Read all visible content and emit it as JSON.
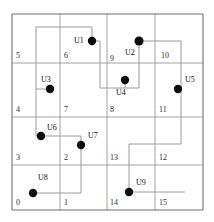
{
  "diagram": {
    "type": "grid-with-nodes-and-paths",
    "grid": {
      "columns": 4,
      "rows": 4,
      "outer_border": {
        "x": 12,
        "y": 14,
        "width": 191,
        "height": 196
      },
      "column_x": [
        12,
        60,
        107,
        155,
        203
      ],
      "row_y": [
        14,
        63,
        117,
        165,
        210
      ],
      "line_color": "#8a8a8a",
      "border_color": "#6f6f6f"
    },
    "cells": [
      {
        "id": "cell-5",
        "label": "5",
        "x": 16,
        "y": 52
      },
      {
        "id": "cell-6",
        "label": "6",
        "x": 64,
        "y": 52
      },
      {
        "id": "cell-9",
        "label": "9",
        "x": 110,
        "y": 55
      },
      {
        "id": "cell-10",
        "label": "10",
        "x": 161,
        "y": 52
      },
      {
        "id": "cell-4",
        "label": "4",
        "x": 16,
        "y": 106
      },
      {
        "id": "cell-7",
        "label": "7",
        "x": 64,
        "y": 106
      },
      {
        "id": "cell-8",
        "label": "8",
        "x": 110,
        "y": 106
      },
      {
        "id": "cell-11",
        "label": "11",
        "x": 159,
        "y": 106
      },
      {
        "id": "cell-3",
        "label": "3",
        "x": 16,
        "y": 154
      },
      {
        "id": "cell-2",
        "label": "2",
        "x": 64,
        "y": 154
      },
      {
        "id": "cell-13",
        "label": "13",
        "x": 110,
        "y": 154
      },
      {
        "id": "cell-12",
        "label": "12",
        "x": 159,
        "y": 154
      },
      {
        "id": "cell-0",
        "label": "0",
        "x": 16,
        "y": 199
      },
      {
        "id": "cell-1",
        "label": "1",
        "x": 64,
        "y": 199
      },
      {
        "id": "cell-14",
        "label": "14",
        "x": 110,
        "y": 199
      },
      {
        "id": "cell-15",
        "label": "15",
        "x": 159,
        "y": 199
      }
    ],
    "nodes": [
      {
        "id": "U1",
        "label": "U1",
        "cx": 92,
        "cy": 41,
        "r": 4.2,
        "label_x": 74,
        "label_y": 37
      },
      {
        "id": "U2",
        "label": "U2",
        "cx": 139,
        "cy": 41,
        "r": 4.5,
        "label_x": 125,
        "label_y": 49
      },
      {
        "id": "U3",
        "label": "U3",
        "cx": 50,
        "cy": 89,
        "r": 4.2,
        "label_x": 41,
        "label_y": 76
      },
      {
        "id": "U4",
        "label": "U4",
        "cx": 125,
        "cy": 80,
        "r": 4.2,
        "label_x": 116,
        "label_y": 89
      },
      {
        "id": "U5",
        "label": "U5",
        "cx": 178,
        "cy": 89,
        "r": 4.2,
        "label_x": 185,
        "label_y": 76
      },
      {
        "id": "U6",
        "label": "U6",
        "cx": 41,
        "cy": 136,
        "r": 4.2,
        "label_x": 47,
        "label_y": 124
      },
      {
        "id": "U7",
        "label": "U7",
        "cx": 81,
        "cy": 145,
        "r": 4.2,
        "label_x": 88,
        "label_y": 132
      },
      {
        "id": "U8",
        "label": "U8",
        "cx": 33,
        "cy": 193,
        "r": 4.2,
        "label_x": 38,
        "label_y": 174
      },
      {
        "id": "U9",
        "label": "U9",
        "cx": 129,
        "cy": 192,
        "r": 4.2,
        "label_x": 136,
        "label_y": 179
      }
    ],
    "paths": [
      {
        "id": "path-u1-u3",
        "points": "92,41 92,27 36,27 36,89 50,89",
        "color": "#9a9a9a"
      },
      {
        "id": "path-u1-u4",
        "points": "92,41 100,41 100,88 125,88 125,80",
        "color": "#9a9a9a"
      },
      {
        "id": "path-u3-u6",
        "points": "36,89 36,136 41,136",
        "color": "#9a9a9a"
      },
      {
        "id": "path-u6-u7",
        "points": "41,136 81,136 81,145",
        "color": "#9a9a9a"
      },
      {
        "id": "path-u7-u8",
        "points": "81,145 81,193 33,193",
        "color": "#9a9a9a"
      },
      {
        "id": "path-u2-u5",
        "points": "139,41 181,41 181,89 178,89",
        "color": "#9a9a9a"
      },
      {
        "id": "path-u2-u4",
        "points": "139,41 139,88 125,88",
        "color": "#9a9a9a"
      },
      {
        "id": "path-u5-u9",
        "points": "181,89 181,144 129,144 129,192",
        "color": "#9a9a9a"
      },
      {
        "id": "path-u9-east",
        "points": "129,192 185,192",
        "color": "#9a9a9a"
      }
    ],
    "style": {
      "node_fill": "#0b0b0b",
      "path_color": "#9a9a9a",
      "grid_color": "#8a8a8a",
      "background": "#ffffff"
    }
  }
}
